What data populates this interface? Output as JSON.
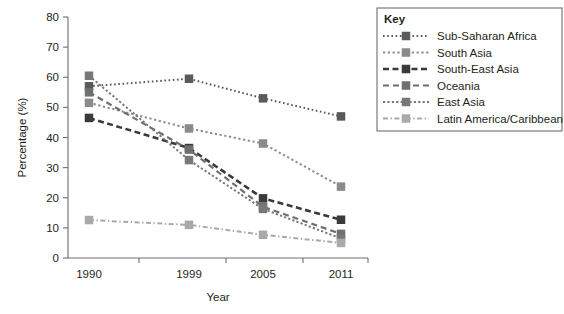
{
  "chart_data": {
    "type": "line",
    "title": "",
    "xlabel": "Year",
    "ylabel": "Percentage (%)",
    "categories": [
      "1990",
      "1999",
      "2005",
      "2011"
    ],
    "xtick_labels": [
      "1990",
      "1999",
      "2005",
      "2011"
    ],
    "ytick_labels": [
      "0",
      "10",
      "20",
      "30",
      "40",
      "50",
      "60",
      "70",
      "80"
    ],
    "ylim": [
      0,
      80
    ],
    "ytick_step": 10,
    "grid": false,
    "legend_position": "right",
    "legend_title": "Key",
    "series": [
      {
        "name": "Sub-Saharan Africa",
        "values": [
          57,
          59.5,
          53,
          47
        ],
        "color": "#595a5c",
        "dash": "1.6 2.6",
        "width": 2.0,
        "marker": "square"
      },
      {
        "name": "South Asia",
        "values": [
          51.5,
          43,
          38,
          23.7
        ],
        "color": "#8a8b8d",
        "dash": "2.2 2.6",
        "width": 2.0,
        "marker": "square"
      },
      {
        "name": "South-East Asia",
        "values": [
          46.5,
          36.5,
          19.8,
          12.7
        ],
        "color": "#3a3a3c",
        "dash": "6 3.5",
        "width": 2.6,
        "marker": "square"
      },
      {
        "name": "Oceania",
        "values": [
          55,
          36,
          17,
          8
        ],
        "color": "#6e6f71",
        "dash": "6 4",
        "width": 2.2,
        "marker": "square"
      },
      {
        "name": "East Asia",
        "values": [
          60.5,
          32.5,
          16.3,
          6.5
        ],
        "color": "#77787a",
        "dash": "2.2 2.2",
        "width": 2.0,
        "marker": "square"
      },
      {
        "name": "Latin America/Caribbean",
        "values": [
          12.6,
          11,
          7.7,
          5
        ],
        "color": "#a7a9ac",
        "dash": "5 2.5 1.4 2.5",
        "width": 2.0,
        "marker": "square"
      }
    ]
  }
}
